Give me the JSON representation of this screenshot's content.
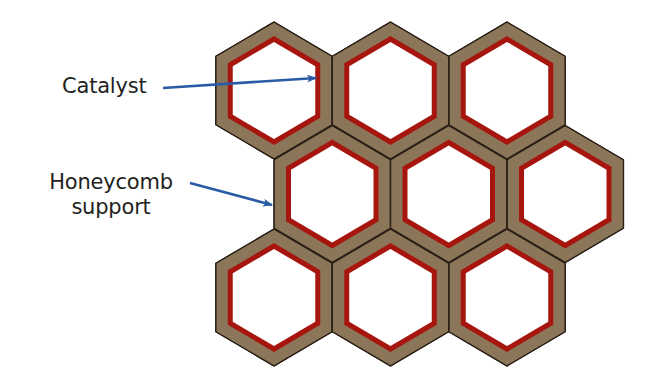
{
  "diagram": {
    "labels": {
      "catalyst": "Catalyst",
      "honeycomb_line1": "Honeycomb",
      "honeycomb_line2": "support"
    },
    "colors": {
      "support_brown": "#8c7659",
      "catalyst_red": "#a6160f",
      "cell_interior": "#ffffff",
      "outline": "#2b2117",
      "arrow_blue": "#2a5ca6",
      "text": "#231f20"
    },
    "geometry": {
      "hex_half_width": 58.25,
      "hex_radius": 68.5,
      "support_band_px": 12,
      "catalyst_band_px": 5
    },
    "cells": [
      {
        "row": 1,
        "col": 1,
        "cx": 274.0,
        "cy": 90.5
      },
      {
        "row": 1,
        "col": 2,
        "cx": 390.5,
        "cy": 90.5
      },
      {
        "row": 1,
        "col": 3,
        "cx": 507.0,
        "cy": 90.5
      },
      {
        "row": 2,
        "col": 1,
        "cx": 332.25,
        "cy": 194.0
      },
      {
        "row": 2,
        "col": 2,
        "cx": 448.75,
        "cy": 194.0
      },
      {
        "row": 2,
        "col": 3,
        "cx": 565.25,
        "cy": 194.0
      },
      {
        "row": 3,
        "col": 1,
        "cx": 274.0,
        "cy": 297.5
      },
      {
        "row": 3,
        "col": 2,
        "cx": 390.5,
        "cy": 297.5
      },
      {
        "row": 3,
        "col": 3,
        "cx": 507.0,
        "cy": 297.5
      }
    ],
    "arrows": [
      {
        "name": "catalyst-arrow",
        "x1": 163,
        "y1": 88,
        "x2": 316,
        "y2": 78
      },
      {
        "name": "honeycomb-support-arrow",
        "x1": 190,
        "y1": 183,
        "x2": 272,
        "y2": 205
      }
    ]
  }
}
